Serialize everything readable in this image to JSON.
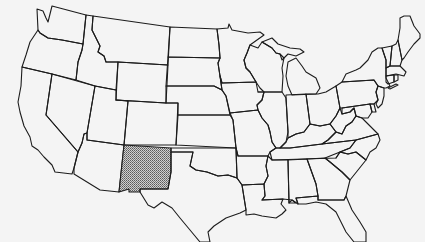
{
  "map": {
    "type": "outline-map",
    "region": "Contiguous United States",
    "style": "black state outlines on light gray background",
    "background_color": "#f4f4f4",
    "stroke_color": "#1c1c1c",
    "highlight": {
      "state": "New Mexico",
      "pattern": "stippled dot fill",
      "color": "#8a8a8a"
    },
    "states": [
      "Washington",
      "Oregon",
      "California",
      "Nevada",
      "Idaho",
      "Montana",
      "Wyoming",
      "Utah",
      "Colorado",
      "Arizona",
      "New Mexico",
      "North Dakota",
      "South Dakota",
      "Nebraska",
      "Kansas",
      "Oklahoma",
      "Texas",
      "Minnesota",
      "Iowa",
      "Missouri",
      "Arkansas",
      "Louisiana",
      "Wisconsin",
      "Illinois",
      "Michigan",
      "Indiana",
      "Ohio",
      "Kentucky",
      "Tennessee",
      "Mississippi",
      "Alabama",
      "Georgia",
      "Florida",
      "South Carolina",
      "North Carolina",
      "Virginia",
      "West Virginia",
      "Maryland",
      "Delaware",
      "New Jersey",
      "Pennsylvania",
      "New York",
      "Connecticut",
      "Rhode Island",
      "Massachusetts",
      "Vermont",
      "New Hampshire",
      "Maine"
    ]
  }
}
